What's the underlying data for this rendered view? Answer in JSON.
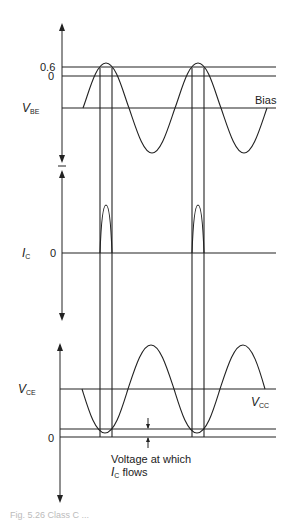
{
  "diagram": {
    "type": "waveform-timing-diagram",
    "panels": [
      {
        "id": "vbe",
        "axis_label": "V",
        "axis_label_sub": "BE",
        "levels": [
          {
            "label": "0.6",
            "y": 67
          },
          {
            "label": "0",
            "y": 76
          },
          {
            "label": "Bias",
            "y": 108
          }
        ]
      },
      {
        "id": "ic",
        "axis_label": "I",
        "axis_label_sub": "C",
        "levels": [
          {
            "label": "0",
            "y": 253
          }
        ]
      },
      {
        "id": "vce",
        "axis_label": "V",
        "axis_label_sub": "CE",
        "levels": [
          {
            "label": "V",
            "sub": "CC",
            "y": 389
          },
          {
            "label": "0",
            "y": 437
          }
        ],
        "annotation_line1": "Voltage at which",
        "annotation_line2_main": "I",
        "annotation_line2_sub": "C",
        "annotation_line2_rest": " flows"
      }
    ]
  },
  "caption": "Fig. 5.26  Class C ..."
}
